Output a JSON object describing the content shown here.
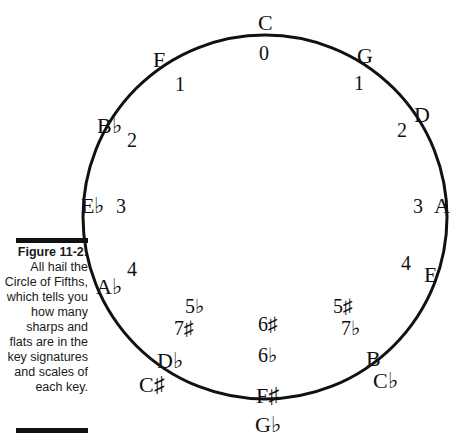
{
  "caption": {
    "figure_label": "Figure 11-2:",
    "text": "All hail the Circle of Fifths, which tells you how many sharps and flats are in the key signatures and scales of each key."
  },
  "diagram": {
    "title": "Circle of Fifths",
    "circle_color": "#111111",
    "keys": [
      {
        "name": "C",
        "count": "0"
      },
      {
        "name": "G",
        "count": "1"
      },
      {
        "name": "D",
        "count": "2"
      },
      {
        "name": "A",
        "count": "3"
      },
      {
        "name": "E",
        "count": "4"
      },
      {
        "name": "B",
        "alt_name": "C♭",
        "count": "5♯",
        "alt_count": "7♭"
      },
      {
        "name": "F♯",
        "alt_name": "G♭",
        "count": "6♯",
        "alt_count": "6♭"
      },
      {
        "name": "D♭",
        "alt_name": "C♯",
        "count": "5♭",
        "alt_count": "7♯"
      },
      {
        "name": "A♭",
        "count": "4"
      },
      {
        "name": "E♭",
        "count": "3"
      },
      {
        "name": "B♭",
        "count": "2"
      },
      {
        "name": "F",
        "count": "1"
      }
    ]
  }
}
